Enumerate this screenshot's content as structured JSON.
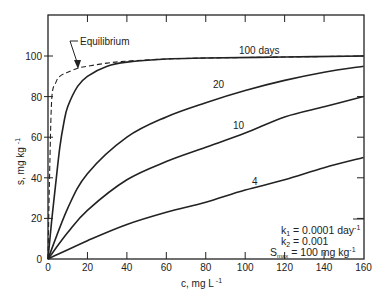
{
  "chart_data": {
    "type": "line",
    "title": "",
    "xlabel": "c, mg L -1",
    "ylabel": "s, mg kg -1",
    "xlim": [
      0,
      160
    ],
    "ylim": [
      0,
      120
    ],
    "x_ticks": [
      0,
      20,
      40,
      60,
      80,
      100,
      120,
      140,
      160
    ],
    "y_ticks": [
      0,
      20,
      40,
      60,
      80,
      100
    ],
    "grid": false,
    "legend": "inline labels",
    "series": [
      {
        "name": "Equilibrium",
        "style": "dashed",
        "x": [
          0,
          1,
          2,
          4,
          6,
          10,
          15,
          20,
          30,
          40,
          60,
          80,
          120,
          160
        ],
        "y": [
          0,
          50,
          80,
          87,
          90,
          92,
          94,
          95,
          96.5,
          97.5,
          98.5,
          99,
          99.5,
          100
        ]
      },
      {
        "name": "100 days",
        "style": "solid",
        "x": [
          0,
          2,
          4,
          6,
          8,
          10,
          15,
          20,
          30,
          40,
          60,
          80,
          120,
          160
        ],
        "y": [
          0,
          20,
          38,
          55,
          67,
          75,
          85,
          90,
          95,
          97,
          98.5,
          99,
          99.5,
          100
        ]
      },
      {
        "name": "20",
        "style": "solid",
        "x": [
          0,
          10,
          20,
          40,
          60,
          80,
          100,
          120,
          140,
          160
        ],
        "y": [
          0,
          25,
          42,
          60,
          70,
          77,
          83,
          88,
          92,
          95
        ]
      },
      {
        "name": "10",
        "style": "solid",
        "x": [
          0,
          10,
          20,
          40,
          60,
          80,
          100,
          120,
          140,
          160
        ],
        "y": [
          0,
          13,
          24,
          39,
          48,
          55,
          62,
          70,
          75,
          80
        ]
      },
      {
        "name": "4",
        "style": "solid",
        "x": [
          0,
          20,
          40,
          60,
          80,
          100,
          120,
          140,
          160
        ],
        "y": [
          0,
          9,
          17,
          23,
          28,
          34,
          39,
          45,
          50
        ]
      }
    ],
    "annotations": [
      {
        "text": "Equilibrium",
        "with_arrow": true
      },
      {
        "text": "100 days"
      },
      {
        "text": "20"
      },
      {
        "text": "10"
      },
      {
        "text": "4"
      },
      {
        "text": "k1 = 0.0001 day -1"
      },
      {
        "text": "k2 = 0.001"
      },
      {
        "text": "Smax = 100 mg kg -1"
      }
    ]
  },
  "labels": {
    "xlabel_main": "c, mg L",
    "xlabel_exp": "-1",
    "ylabel_main": "s, mg kg",
    "ylabel_exp": "-1",
    "equilibrium": "Equilibrium",
    "days100": "100 days",
    "days20": "20",
    "days10": "10",
    "days4": "4",
    "k1_pre": "k",
    "k1_sub": "1",
    "k1_val": " = 0.0001 day",
    "k1_exp": "-1",
    "k2_pre": "k",
    "k2_sub": "2",
    "k2_val": " = 0.001",
    "smax_pre": "S",
    "smax_sub": "max",
    "smax_val": " = 100 mg kg",
    "smax_exp": "-1"
  }
}
